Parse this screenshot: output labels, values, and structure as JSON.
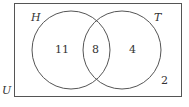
{
  "diagram": {
    "type": "venn",
    "universe_label": "U",
    "sets": [
      {
        "label": "H",
        "only": "11"
      },
      {
        "label": "T",
        "only": "4"
      }
    ],
    "intersection": "8",
    "outside": "2"
  }
}
